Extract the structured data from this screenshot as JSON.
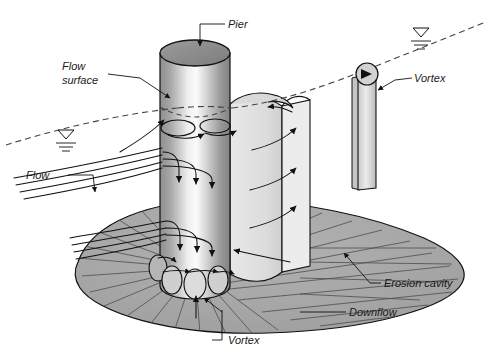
{
  "labels": {
    "pier": "Pier",
    "flow_surface_line1": "Flow",
    "flow_surface_line2": "surface",
    "flow": "Flow",
    "vortex_wake": "Vortex",
    "vortex_base": "Vortex",
    "erosion_cavity": "Erosion cavity",
    "downflow": "Downflow"
  },
  "icons": {
    "water_level_left": "water-level-symbol",
    "water_level_right": "water-level-symbol",
    "rotation_arrow": "vortex-rotation-arrowhead"
  },
  "colors": {
    "line": "#111111",
    "pier_top_fill": "#8c8c8c",
    "pier_body_light": "#f2f2f2",
    "pier_body_dark": "#7a7a7a",
    "wake_sheet_fill": "#e3e3e3",
    "cavity_fill": "#a8a8a8",
    "cavity_hatch": "#4d4d4d",
    "vortex_tube_fill": "#dcdcdc",
    "background": "#ffffff",
    "text": "#1a1a1a"
  },
  "counts": {
    "surface_rollers": 2,
    "downflow_arrows_upper": 3,
    "downflow_arrows_lower": 3,
    "horseshoe_vortex_ellipses": 4,
    "wake_sheet_arrows": 3,
    "approach_streamlines_upper": 4,
    "approach_streamlines_lower": 4,
    "cavity_radial_lines": 30
  }
}
